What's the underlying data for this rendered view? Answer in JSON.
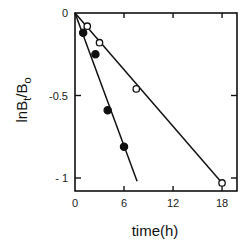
{
  "chart_data": {
    "type": "scatter",
    "title": "",
    "xlabel": "time(h)",
    "ylabel": "lnBt/Bo",
    "ylabel_parts": {
      "main": "lnB",
      "sub1": "t",
      "mid": "/B",
      "sub2": "o"
    },
    "xlim": [
      0,
      19
    ],
    "ylim": [
      -1.07,
      0
    ],
    "xticks": [
      0,
      6,
      12,
      18
    ],
    "xtick_labels": [
      "0",
      "6",
      "12",
      "18"
    ],
    "yticks": [
      0,
      -0.5,
      -1
    ],
    "ytick_labels": [
      "0",
      "-0.5",
      "- 1"
    ],
    "grid": false,
    "legend": null,
    "series": [
      {
        "name": "open circles",
        "marker": "open-circle",
        "x": [
          1.5,
          3,
          7.5,
          18
        ],
        "y": [
          -0.08,
          -0.18,
          -0.46,
          -1.03
        ],
        "fit_line": {
          "x": [
            0,
            18
          ],
          "y": [
            0,
            -1.03
          ]
        }
      },
      {
        "name": "filled circles",
        "marker": "filled-circle",
        "x": [
          1,
          2.5,
          4,
          6
        ],
        "y": [
          -0.12,
          -0.25,
          -0.59,
          -0.81
        ],
        "fit_line": {
          "x": [
            0,
            7.6
          ],
          "y": [
            0,
            -1.02
          ]
        }
      }
    ]
  },
  "colors": {
    "ink": "#111111",
    "background": "#ffffff"
  }
}
